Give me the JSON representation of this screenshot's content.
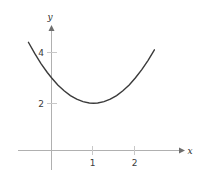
{
  "figure": {
    "kind": "cartesian-plot",
    "background_color": "#ffffff",
    "axis_color": "#b0b0b0",
    "tick_color": "#c8c8c8",
    "curve_color": "#3a3a3a",
    "label_color": "#3c3c3c"
  },
  "axes": {
    "x_axis_label": "x",
    "y_axis_label": "y",
    "x_ticks": [
      {
        "value": 1,
        "label": "1"
      },
      {
        "value": 2,
        "label": "2"
      }
    ],
    "y_ticks": [
      {
        "value": 2,
        "label": "2"
      },
      {
        "value": 4,
        "label": "4"
      }
    ]
  },
  "chart_data": {
    "type": "line",
    "title": "",
    "xlabel": "x",
    "ylabel": "y",
    "grid": false,
    "legend": "none",
    "xlim": [
      -0.55,
      2.45
    ],
    "ylim": [
      0,
      4.4
    ],
    "xticks": [
      1,
      2
    ],
    "xticklabels": [
      "1",
      "2"
    ],
    "yticks": [
      2,
      4
    ],
    "yticklabels": [
      "2",
      "4"
    ],
    "series": [
      {
        "name": "parabola",
        "equation": "y = (x - 1)^2 + 2",
        "vertex": [
          1,
          2
        ],
        "color": "#3a3a3a",
        "x": [
          -0.55,
          -0.4,
          -0.25,
          -0.1,
          0.0,
          0.15,
          0.3,
          0.45,
          0.6,
          0.75,
          0.9,
          1.0,
          1.1,
          1.25,
          1.4,
          1.55,
          1.7,
          1.85,
          2.0,
          2.15,
          2.3,
          2.45
        ],
        "y": [
          4.4,
          3.96,
          3.56,
          3.21,
          3.0,
          2.72,
          2.49,
          2.3,
          2.16,
          2.06,
          2.01,
          2.0,
          2.01,
          2.06,
          2.16,
          2.3,
          2.49,
          2.72,
          3.0,
          3.32,
          3.69,
          4.1
        ]
      }
    ]
  }
}
